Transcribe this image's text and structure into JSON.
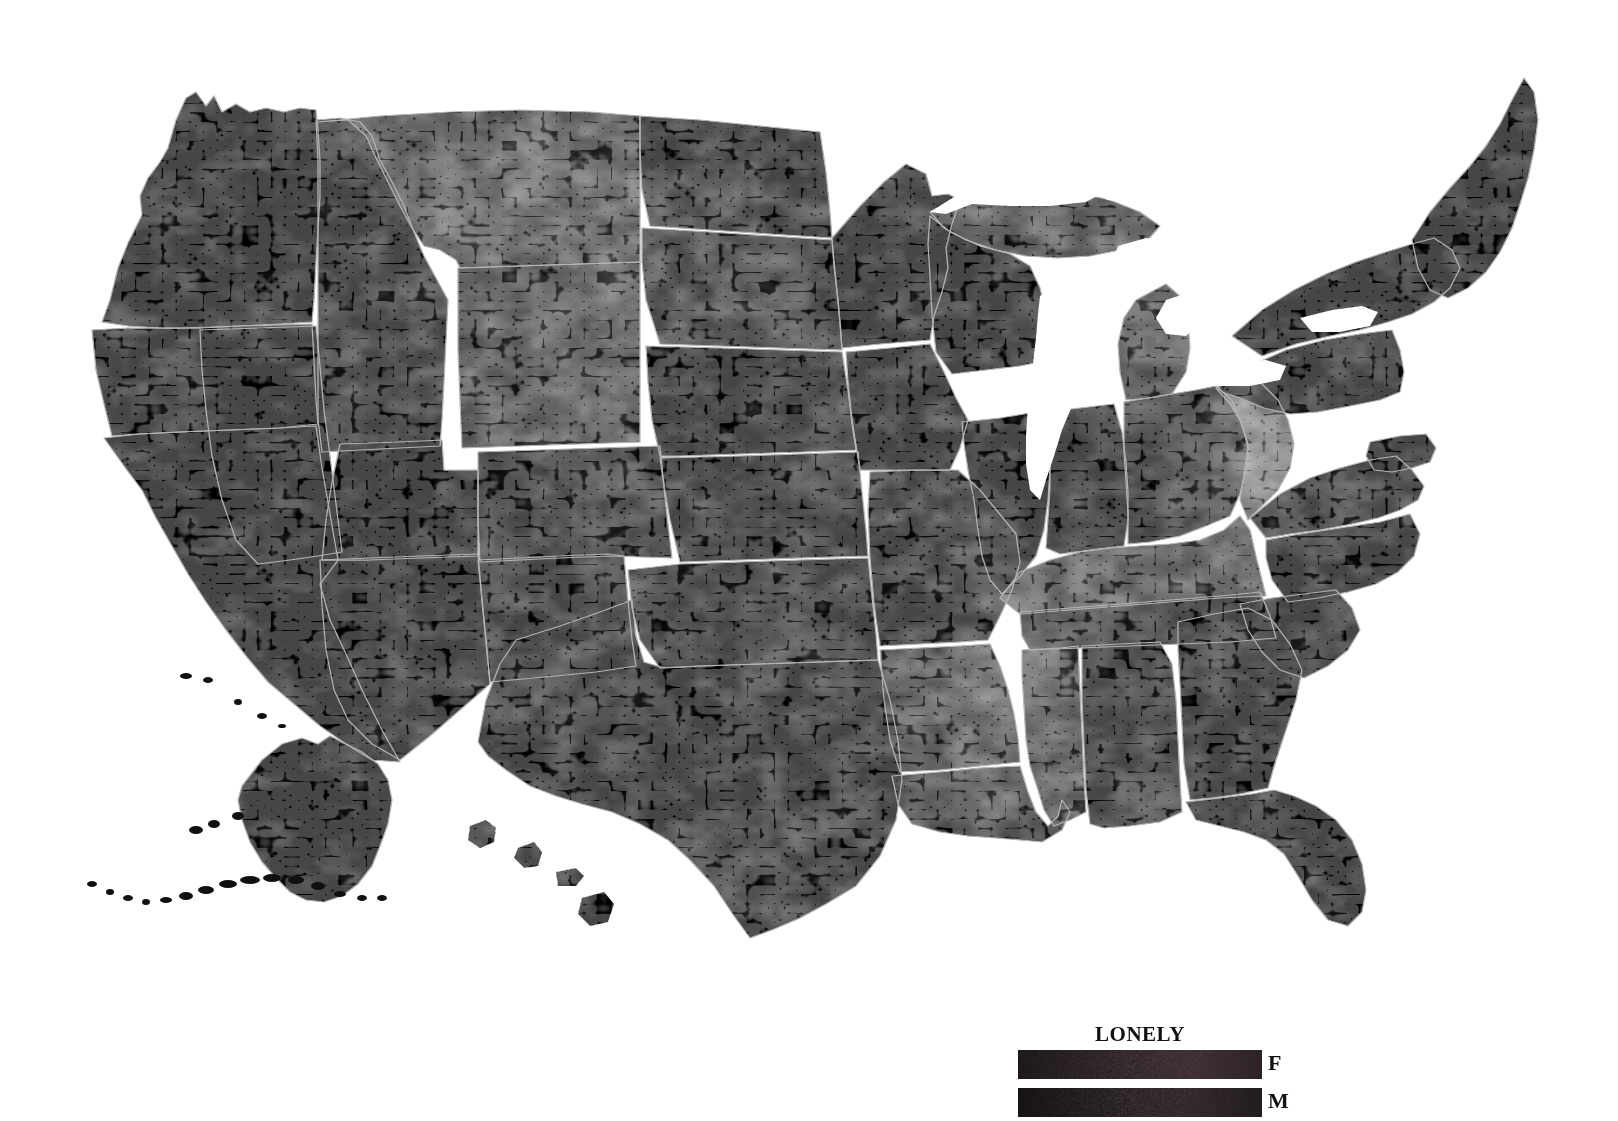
{
  "figure": {
    "type": "choropleth-map",
    "region": "United States (counties, with Alaska and Hawaii insets)",
    "background_color": "#ffffff",
    "border_color": "#b4b4b4",
    "water_color": "#ffffff"
  },
  "legend": {
    "title": "LONELY",
    "title_color": "#111111",
    "position": "bottom-right",
    "rows": [
      {
        "label": "F",
        "name": "female",
        "gradient_low": "#1a1517",
        "gradient_high": "#3a2b30",
        "gradient_mid": "#2b2023"
      },
      {
        "label": "M",
        "name": "male",
        "gradient_low": "#120f12",
        "gradient_high": "#2e2428",
        "gradient_mid": "#201a1d"
      }
    ]
  },
  "chart_data": {
    "type": "heatmap",
    "title": "LONELY",
    "xlabel": "",
    "ylabel": "",
    "legend_position": "bottom-right",
    "grid": false,
    "colorscale": [
      "#000000",
      "#101010",
      "#1e1e1e",
      "#2c2c2c",
      "#3a3a3a",
      "#4a4a4a",
      "#5a5a5a"
    ],
    "value_note": "Darker = lower value, lighter gray = higher value",
    "series": [
      {
        "name": "F",
        "values": []
      },
      {
        "name": "M",
        "values": []
      }
    ],
    "regions": [
      {
        "name": "Washington",
        "shade": "#0a0a0a"
      },
      {
        "name": "Oregon",
        "shade": "#0c0c0c"
      },
      {
        "name": "Idaho",
        "shade": "#131313"
      },
      {
        "name": "Montana",
        "shade": "#2c2c2c"
      },
      {
        "name": "Wyoming",
        "shade": "#2a2a2a"
      },
      {
        "name": "North Dakota",
        "shade": "#141414"
      },
      {
        "name": "South Dakota",
        "shade": "#1a1a1a"
      },
      {
        "name": "Nebraska",
        "shade": "#161616"
      },
      {
        "name": "Minnesota",
        "shade": "#0e0e0e"
      },
      {
        "name": "Wisconsin",
        "shade": "#0d0d0d"
      },
      {
        "name": "Michigan",
        "shade": "#242424"
      },
      {
        "name": "Iowa",
        "shade": "#101010"
      },
      {
        "name": "Illinois",
        "shade": "#0f0f0f"
      },
      {
        "name": "Indiana",
        "shade": "#121212"
      },
      {
        "name": "Ohio",
        "shade": "#181818"
      },
      {
        "name": "Pennsylvania",
        "shade": "#0b0b0b"
      },
      {
        "name": "New York",
        "shade": "#090909"
      },
      {
        "name": "New England",
        "shade": "#060606"
      },
      {
        "name": "Maine",
        "shade": "#070707"
      },
      {
        "name": "West Virginia",
        "shade": "#3e3e3e"
      },
      {
        "name": "Kentucky",
        "shade": "#333333"
      },
      {
        "name": "Tennessee",
        "shade": "#1c1c1c"
      },
      {
        "name": "Virginia",
        "shade": "#131313"
      },
      {
        "name": "North Carolina",
        "shade": "#101010"
      },
      {
        "name": "South Carolina",
        "shade": "#0e0e0e"
      },
      {
        "name": "Georgia",
        "shade": "#0f0f0f"
      },
      {
        "name": "Florida",
        "shade": "#0c0c0c"
      },
      {
        "name": "Alabama",
        "shade": "#151515"
      },
      {
        "name": "Mississippi",
        "shade": "#2b2b2b"
      },
      {
        "name": "Louisiana",
        "shade": "#1f1f1f"
      },
      {
        "name": "Arkansas",
        "shade": "#262626"
      },
      {
        "name": "Missouri",
        "shade": "#181818"
      },
      {
        "name": "Kansas",
        "shade": "#151515"
      },
      {
        "name": "Oklahoma",
        "shade": "#191919"
      },
      {
        "name": "Texas",
        "shade": "#121212"
      },
      {
        "name": "New Mexico",
        "shade": "#161616"
      },
      {
        "name": "Arizona",
        "shade": "#0d0d0d"
      },
      {
        "name": "Colorado",
        "shade": "#141414"
      },
      {
        "name": "Utah",
        "shade": "#0b0b0b"
      },
      {
        "name": "Nevada",
        "shade": "#070707"
      },
      {
        "name": "California",
        "shade": "#060606"
      },
      {
        "name": "Alaska",
        "shade": "#080808"
      },
      {
        "name": "Hawaii",
        "shade": "#0a0a0a"
      }
    ]
  }
}
